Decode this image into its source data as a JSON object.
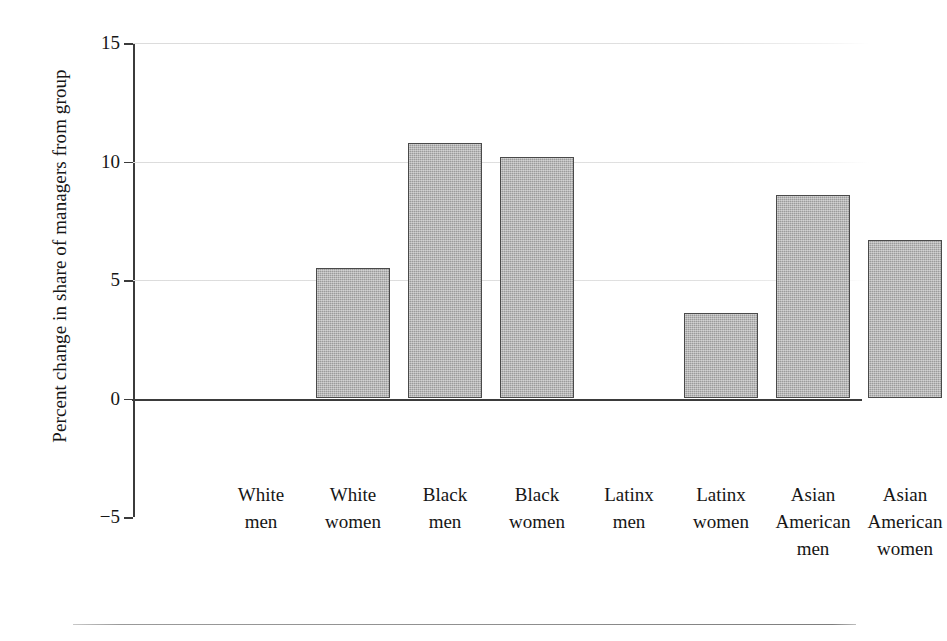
{
  "chart_data": {
    "type": "bar",
    "title": "",
    "subtitle": "",
    "xlabel": "",
    "ylabel": "Percent change in share of managers from group",
    "categories": [
      "White men",
      "White women",
      "Black men",
      "Black women",
      "Latinx men",
      "Latinx women",
      "Asian American men",
      "Asian American women"
    ],
    "category_lines": [
      [
        "White",
        "men"
      ],
      [
        "White",
        "women"
      ],
      [
        "Black",
        "men"
      ],
      [
        "Black",
        "women"
      ],
      [
        "Latinx",
        "men"
      ],
      [
        "Latinx",
        "women"
      ],
      [
        "Asian",
        "American",
        "men"
      ],
      [
        "Asian",
        "American",
        "women"
      ]
    ],
    "values": [
      0,
      5.5,
      10.8,
      10.2,
      0,
      3.6,
      8.6,
      6.7
    ],
    "ylim": [
      -5,
      15
    ],
    "yticks": [
      15,
      10,
      5,
      0,
      -5
    ],
    "ytick_labels": [
      "15",
      "10",
      "5",
      "0",
      "−5"
    ],
    "gridlines_at": [
      15,
      10,
      5
    ],
    "zero_line_at": 0,
    "grid": true,
    "legend": "none",
    "bar_color": "#a9a9a9",
    "bar_edge_color": "#4a4a4a",
    "grid_color": "#e2e2e2",
    "axis_color": "#3b3b3b",
    "annotations": []
  },
  "figure": {
    "bottom_rule": true
  }
}
